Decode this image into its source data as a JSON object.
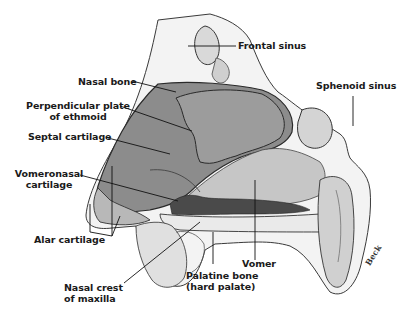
{
  "figure": {
    "signature": "Beck",
    "colors": {
      "bone_light": "#e6e6e6",
      "septal_cartilage": "#8a8a8a",
      "ethmoid_plate": "#9a9a9a",
      "vomer": "#c4c4c4",
      "vomeronasal_dark": "#4a4a4a",
      "outline": "#2a2a2a",
      "leader": "#111111"
    },
    "labels": [
      {
        "id": "frontal-sinus",
        "lines": [
          "Frontal sinus"
        ]
      },
      {
        "id": "nasal-bone",
        "lines": [
          "Nasal bone"
        ]
      },
      {
        "id": "sphenoid-sinus",
        "lines": [
          "Sphenoid sinus"
        ]
      },
      {
        "id": "perpendicular-plate",
        "lines": [
          "Perpendicular plate",
          "of ethmoid"
        ]
      },
      {
        "id": "septal-cartilage",
        "lines": [
          "Septal cartilage"
        ]
      },
      {
        "id": "vomeronasal-cartilage",
        "lines": [
          "Vomeronasal",
          "cartilage"
        ]
      },
      {
        "id": "alar-cartilage",
        "lines": [
          "Alar cartilage"
        ]
      },
      {
        "id": "vomer",
        "lines": [
          "Vomer"
        ]
      },
      {
        "id": "nasal-crest",
        "lines": [
          "Nasal crest",
          "of maxilla"
        ]
      },
      {
        "id": "palatine-bone",
        "lines": [
          "Palatine bone",
          "(hard palate)"
        ]
      }
    ]
  }
}
